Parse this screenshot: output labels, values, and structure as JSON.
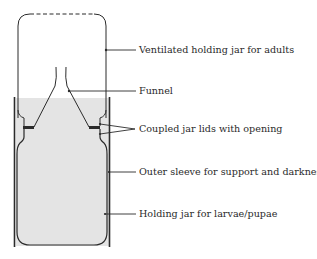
{
  "diagram": {
    "type": "labeled-apparatus",
    "colors": {
      "stroke": "#2b2b2b",
      "fill_medium": "#e4e4e4",
      "background": "#ffffff"
    },
    "labels": [
      {
        "id": "top-jar",
        "text": "Ventilated holding jar for adults"
      },
      {
        "id": "funnel",
        "text": "Funnel"
      },
      {
        "id": "lids",
        "text": "Coupled jar lids with opening"
      },
      {
        "id": "sleeve",
        "text": "Outer sleeve for support and darkness"
      },
      {
        "id": "bottom-jar",
        "text": "Holding jar for larvae/pupae"
      }
    ]
  }
}
